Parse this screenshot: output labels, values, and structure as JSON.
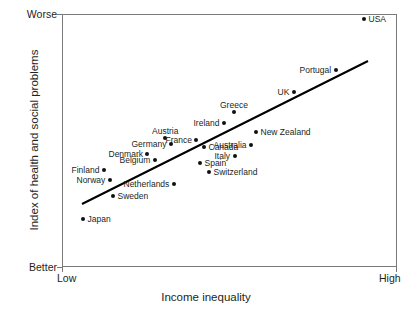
{
  "chart_data": {
    "type": "scatter",
    "title": "",
    "xlabel": "Income inequality",
    "ylabel": "Index of health and social problems",
    "x_tick_labels": [
      "Low",
      "High"
    ],
    "y_tick_labels": [
      "Worse",
      "Better"
    ],
    "xlim": [
      0,
      100
    ],
    "ylim": [
      0,
      100
    ],
    "grid": false,
    "legend": "none",
    "annotations": [
      "trend line (positive linear fit)"
    ],
    "points": [
      {
        "label": "Japan",
        "x": 6.3,
        "y": 19.0,
        "px": 83,
        "py": 219,
        "side": "right"
      },
      {
        "label": "Finland",
        "x": 12.5,
        "y": 38.3,
        "px": 104,
        "py": 170,
        "side": "left"
      },
      {
        "label": "Norway",
        "x": 14.3,
        "y": 34.4,
        "px": 110,
        "py": 180,
        "side": "left"
      },
      {
        "label": "Sweden",
        "x": 15.2,
        "y": 28.1,
        "px": 113,
        "py": 196,
        "side": "right"
      },
      {
        "label": "Denmark",
        "x": 25.4,
        "y": 44.7,
        "px": 147,
        "py": 154,
        "side": "left"
      },
      {
        "label": "Belgium",
        "x": 27.8,
        "y": 42.3,
        "px": 155,
        "py": 160,
        "side": "above-left"
      },
      {
        "label": "Netherlands",
        "x": 33.4,
        "y": 32.8,
        "px": 174,
        "py": 184,
        "side": "left"
      },
      {
        "label": "Austria",
        "x": 30.7,
        "y": 51.0,
        "px": 165,
        "py": 138,
        "side": "above"
      },
      {
        "label": "Germany",
        "x": 32.5,
        "y": 48.6,
        "px": 171,
        "py": 144,
        "side": "left"
      },
      {
        "label": "France",
        "x": 40.0,
        "y": 50.2,
        "px": 196,
        "py": 140,
        "side": "left"
      },
      {
        "label": "Canada",
        "x": 42.4,
        "y": 47.4,
        "px": 204,
        "py": 147,
        "side": "right"
      },
      {
        "label": "Spain",
        "x": 41.2,
        "y": 41.1,
        "px": 200,
        "py": 163,
        "side": "right"
      },
      {
        "label": "Switzerland",
        "x": 43.9,
        "y": 37.5,
        "px": 209,
        "py": 172,
        "side": "right"
      },
      {
        "label": "Ireland",
        "x": 48.4,
        "y": 56.9,
        "px": 224,
        "py": 123,
        "side": "left"
      },
      {
        "label": "Greece",
        "x": 51.3,
        "y": 61.3,
        "px": 234,
        "py": 112,
        "side": "above"
      },
      {
        "label": "Italy",
        "x": 51.6,
        "y": 43.9,
        "px": 235,
        "py": 156,
        "side": "left"
      },
      {
        "label": "Australia",
        "x": 56.4,
        "y": 48.2,
        "px": 251,
        "py": 145,
        "side": "left"
      },
      {
        "label": "New Zealand",
        "x": 57.9,
        "y": 53.4,
        "px": 256,
        "py": 132,
        "side": "right"
      },
      {
        "label": "UK",
        "x": 69.3,
        "y": 69.2,
        "px": 294,
        "py": 92,
        "side": "left"
      },
      {
        "label": "Portugal",
        "x": 81.8,
        "y": 77.9,
        "px": 336,
        "py": 70,
        "side": "left"
      },
      {
        "label": "USA",
        "x": 90.1,
        "y": 98.0,
        "px": 364,
        "py": 19,
        "side": "right"
      }
    ],
    "trend_line": {
      "x1": 82,
      "y1": 204,
      "x2": 368,
      "y2": 61
    }
  },
  "axes": {
    "x_title": "Income inequality",
    "y_title": "Index of health and social problems",
    "x_low": "Low",
    "x_high": "High",
    "y_worse": "Worse",
    "y_better": "Better"
  },
  "colors": {
    "point": "#111111",
    "frame": "#7a7a7a",
    "text": "#231f20",
    "trend": "#000000",
    "background": "#ffffff"
  }
}
